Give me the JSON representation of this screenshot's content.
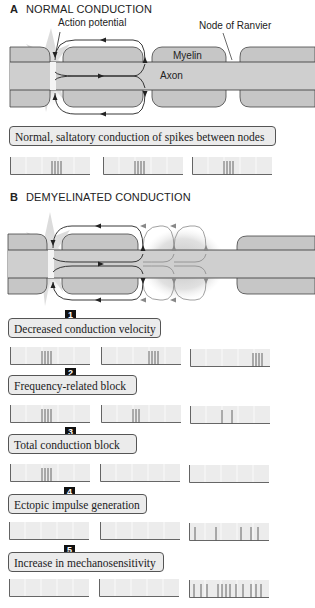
{
  "section_a": {
    "letter": "A",
    "title": "NORMAL CONDUCTION",
    "labels": {
      "action_potential": "Action potential",
      "node_of_ranvier": "Node of Ranvier",
      "myelin": "Myelin",
      "axon": "Axon"
    },
    "callout": "Normal, saltatory conduction of spikes between nodes",
    "traces": [
      {
        "spikes": [
          42,
          45,
          48,
          51
        ]
      },
      {
        "spikes": [
          32,
          35,
          38,
          41
        ]
      },
      {
        "spikes": [
          32,
          35,
          38,
          41
        ]
      }
    ]
  },
  "section_b": {
    "letter": "B",
    "title": "DEMYELINATED CONDUCTION",
    "items": [
      {
        "number": "1",
        "label": "Decreased conduction velocity",
        "traces": [
          {
            "spikes": [
              32,
              35,
              38,
              41
            ]
          },
          {
            "spikes": [
              48,
              51,
              54,
              57
            ]
          },
          {
            "spikes": [
              63,
              66,
              69,
              72
            ]
          }
        ]
      },
      {
        "number": "2",
        "label": "Frequency-related block",
        "traces": [
          {
            "spikes": [
              32,
              35,
              38,
              41
            ]
          },
          {
            "spikes": [
              32,
              35,
              38
            ]
          },
          {
            "spikes": [
              32,
              42
            ]
          }
        ]
      },
      {
        "number": "3",
        "label": "Total conduction  block",
        "traces": [
          {
            "spikes": [
              32,
              35,
              38,
              41
            ]
          },
          {
            "spikes": []
          },
          {
            "spikes": []
          }
        ]
      },
      {
        "number": "4",
        "label": "Ectopic impulse generation",
        "traces": [
          {
            "spikes": []
          },
          {
            "spikes": []
          },
          {
            "spikes": [
              6,
              27,
              52,
              62,
              69
            ]
          }
        ]
      },
      {
        "number": "5",
        "label": "Increase in mechanosensitivity",
        "traces": [
          {
            "spikes": []
          },
          {
            "spikes": []
          },
          {
            "spikes": [
              5,
              12,
              18,
              29,
              33,
              37,
              41,
              47,
              54,
              62,
              67,
              72
            ]
          }
        ]
      }
    ]
  },
  "colors": {
    "myelin": "#c6c6c6",
    "axon": "#cfcfcf",
    "outline": "#444444",
    "callout_bg": "#ebebeb",
    "trace_bg": "#ececec",
    "badge": "#111111"
  }
}
